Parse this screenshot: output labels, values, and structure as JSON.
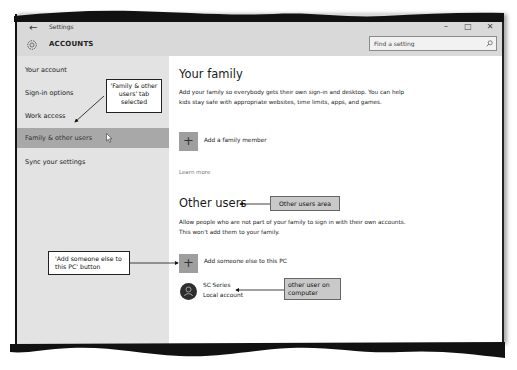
{
  "window": {
    "app_title": "Settings",
    "section_title": "ACCOUNTS",
    "controls": {
      "minimize": "–",
      "maximize": "□",
      "close": "✕"
    },
    "back_glyph": "←"
  },
  "search": {
    "placeholder": "Find a setting",
    "icon": "search-icon"
  },
  "sidebar": {
    "items": [
      {
        "label": "Your account",
        "selected": false
      },
      {
        "label": "Sign-in options",
        "selected": false
      },
      {
        "label": "Work access",
        "selected": false
      },
      {
        "label": "Family & other users",
        "selected": true
      },
      {
        "label": "Sync your settings",
        "selected": false
      }
    ]
  },
  "content": {
    "family": {
      "heading": "Your family",
      "description": "Add your family so everybody gets their own sign-in and desktop. You can help kids stay safe with appropriate websites, time limits, apps, and games.",
      "add_button_glyph": "+",
      "add_label": "Add a family member",
      "learn_more": "Learn more"
    },
    "other_users": {
      "heading": "Other users",
      "description": "Allow people who are not part of your family to sign in with their own accounts. This won't add them to your family.",
      "add_button_glyph": "+",
      "add_label": "Add someone else to this PC",
      "users": [
        {
          "name": "SC Series",
          "type": "Local account"
        }
      ]
    }
  },
  "callouts": {
    "tab_selected": "'Family & other users' tab selected",
    "other_users_area": "Other users area",
    "add_someone_button": "'Add someone else to this PC' button",
    "other_user": "other user on computer"
  },
  "colors": {
    "titlebar": "#d9d9d9",
    "sidebar": "#e3e3e3",
    "selected_item": "#a8a8a8",
    "add_button": "#9e9e9e",
    "avatar": "#2e2e2e",
    "callout_gray": "#c9c9c9"
  }
}
